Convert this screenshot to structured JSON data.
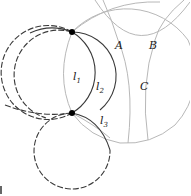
{
  "diagram": {
    "colors": {
      "dark": "#3a3a3a",
      "gray": "#b8b8b8",
      "point": "#000000",
      "background": "#ffffff"
    },
    "points": [
      {
        "name": "top-intersection",
        "x": 72,
        "y": 32
      },
      {
        "name": "bottom-intersection",
        "x": 72,
        "y": 113
      }
    ],
    "labels": {
      "A": "A",
      "B": "B",
      "C": "C",
      "l1": {
        "base": "l",
        "sub": "1"
      },
      "l2": {
        "base": "l",
        "sub": "2"
      },
      "l3": {
        "base": "l",
        "sub": "3"
      }
    }
  }
}
